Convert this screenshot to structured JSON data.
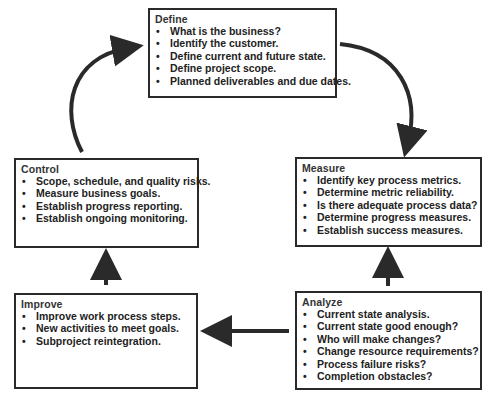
{
  "diagram": {
    "type": "cycle",
    "stages": [
      {
        "id": "define",
        "title": "Define",
        "items": [
          "What is the business?",
          "Identify the customer.",
          "Define current and future state.",
          "Define project scope.",
          "Planned deliverables and due dates."
        ]
      },
      {
        "id": "measure",
        "title": "Measure",
        "items": [
          "Identify key process metrics.",
          "Determine metric reliability.",
          "Is there adequate process data?",
          "Determine progress measures.",
          "Establish success measures."
        ]
      },
      {
        "id": "analyze",
        "title": "Analyze",
        "items": [
          "Current state analysis.",
          "Current state good enough?",
          "Who will make changes?",
          "Change resource requirements?",
          "Process failure risks?",
          "Completion obstacles?"
        ]
      },
      {
        "id": "improve",
        "title": "Improve",
        "items": [
          "Improve work process steps.",
          "New activities to meet goals.",
          "Subproject reintegration."
        ]
      },
      {
        "id": "control",
        "title": "Control",
        "items": [
          "Scope, schedule, and quality risks.",
          "Measure business goals.",
          "Establish progress reporting.",
          "Establish ongoing monitoring."
        ]
      }
    ],
    "flow": [
      {
        "from": "Define",
        "to": "Measure",
        "style": "curved"
      },
      {
        "from": "Measure",
        "to": "Analyze",
        "style": "straight-up",
        "note": "arrow points from Analyze up to Measure"
      },
      {
        "from": "Analyze",
        "to": "Improve",
        "style": "straight-left"
      },
      {
        "from": "Improve",
        "to": "Control",
        "style": "straight-up"
      },
      {
        "from": "Control",
        "to": "Define",
        "style": "curved"
      }
    ],
    "bullet": "•",
    "colors": {
      "stroke": "#2a2a2a",
      "background": "#ffffff",
      "text": "#222222"
    }
  }
}
